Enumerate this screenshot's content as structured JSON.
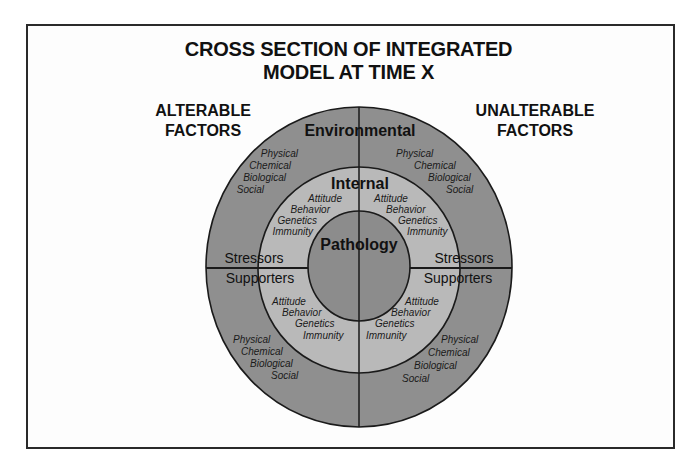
{
  "title": {
    "line1": "CROSS SECTION OF INTEGRATED",
    "line2": "MODEL AT TIME X"
  },
  "side_labels": {
    "left": {
      "line1": "ALTERABLE",
      "line2": "FACTORS"
    },
    "right": {
      "line1": "UNALTERABLE",
      "line2": "FACTORS"
    }
  },
  "rings": {
    "outer": {
      "label": "Environmental",
      "color": "#8f8f8f"
    },
    "middle": {
      "label": "Internal",
      "color": "#b9b9b9"
    },
    "inner": {
      "label": "Pathology",
      "color": "#8c8c8c"
    }
  },
  "half_labels": {
    "upper_left": "Stressors",
    "upper_right": "Stressors",
    "lower_left": "Supporters",
    "lower_right": "Supporters"
  },
  "environmental_factors": {
    "upper_left": [
      "Physical",
      "Chemical",
      "Biological",
      "Social"
    ],
    "upper_right": [
      "Physical",
      "Chemical",
      "Biological",
      "Social"
    ],
    "lower_left": [
      "Physical",
      "Chemical",
      "Biological",
      "Social"
    ],
    "lower_right": [
      "Physical",
      "Chemical",
      "Biological",
      "Social"
    ]
  },
  "internal_factors": {
    "upper_left": [
      "Attitude",
      "Behavior",
      "Genetics",
      "Immunity"
    ],
    "upper_right": [
      "Attitude",
      "Behavior",
      "Genetics",
      "Immunity"
    ],
    "lower_left": [
      "Attitude",
      "Behavior",
      "Genetics",
      "Immunity"
    ],
    "lower_right": [
      "Attitude",
      "Behavior",
      "Genetics",
      "Immunity"
    ]
  }
}
